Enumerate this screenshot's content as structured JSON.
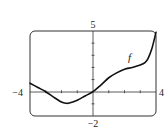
{
  "chart_data": {
    "type": "line",
    "title": "",
    "xlabel": "",
    "ylabel": "",
    "xlim": [
      -4,
      4
    ],
    "ylim": [
      -2,
      5
    ],
    "grid": false,
    "legend": "none",
    "tick_labels": {
      "x_min": "−4",
      "x_max": "4",
      "y_max": "5",
      "y_min": "−2"
    },
    "x_ticks": [
      -3,
      -2,
      -1,
      1,
      2,
      3
    ],
    "y_ticks": [
      -1,
      1,
      2,
      3,
      4
    ],
    "series": [
      {
        "name": "f",
        "label": "f",
        "x": [
          -4,
          -3.5,
          -3,
          -2.5,
          -2,
          -1.7,
          -1.5,
          -1,
          -0.5,
          0,
          0.5,
          1,
          1.5,
          2,
          2.5,
          3,
          3.3,
          3.5,
          3.75,
          4
        ],
        "y": [
          0.7,
          0.35,
          0.0,
          -0.45,
          -0.85,
          -0.95,
          -0.93,
          -0.7,
          -0.35,
          0.0,
          0.55,
          1.15,
          1.55,
          1.85,
          2.0,
          2.2,
          2.4,
          2.75,
          3.6,
          4.9
        ]
      }
    ],
    "annotations": [
      {
        "text": "f",
        "x": 2.35,
        "y": 2.75,
        "style": "italic"
      }
    ]
  }
}
